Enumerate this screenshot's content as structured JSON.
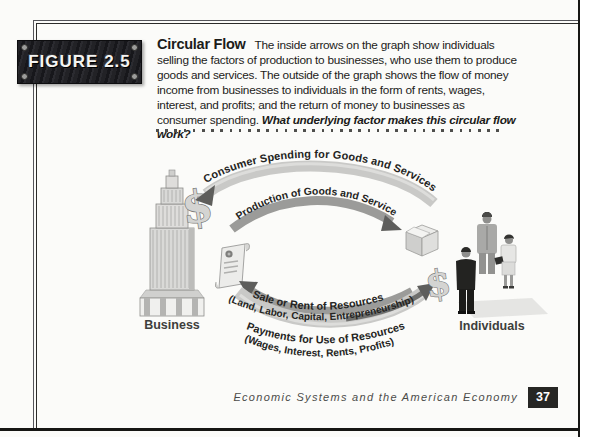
{
  "figure": {
    "label": "FIGURE 2.5"
  },
  "caption": {
    "heading": "Circular Flow",
    "body": "The inside arrows on the graph show individuals selling the factors of production to businesses, who use them to produce goods and services. The outside of the graph shows the flow of money income from businesses to individuals in the form of rents, wages, interest, and profits; and the return of money to businesses as consumer spending.",
    "question": "What underlying factor makes this circular flow work?"
  },
  "diagram": {
    "business_label": "Business",
    "individuals_label": "Individuals",
    "money_symbol": "$",
    "flows": [
      {
        "label": "Consumer Spending for Goods and Services",
        "direction": "to-business"
      },
      {
        "label": "Production of Goods and Services",
        "direction": "to-individuals"
      },
      {
        "label": "Sale or Rent of Resources",
        "sublabel": "(Land, Labor, Capital, Entrepreneurship)",
        "direction": "to-business"
      },
      {
        "label": "Payments for Use of Resources",
        "sublabel": "(Wages, Interest, Rents, Profits)",
        "direction": "to-individuals"
      }
    ]
  },
  "footer": {
    "running_title": "Economic Systems and the American Economy",
    "page_number": "37"
  },
  "colors": {
    "plate_background": "#1b1b1f",
    "page_edge": "#161614",
    "arc_light": "#c9c9c7",
    "arc_dark": "#9b9b99",
    "arrowhead": "#5e5e5c",
    "text": "#1c1c1a"
  }
}
